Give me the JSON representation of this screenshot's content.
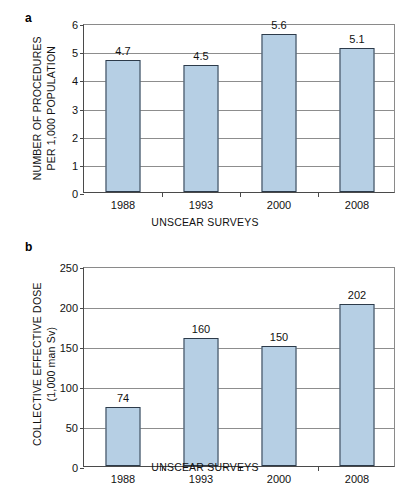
{
  "figure": {
    "panels": [
      {
        "letter": "a",
        "chart_data": {
          "type": "bar",
          "title": "",
          "subtitle": "",
          "categories": [
            "1988",
            "1993",
            "2000",
            "2008"
          ],
          "values": [
            4.7,
            4.5,
            5.6,
            5.1
          ],
          "data_labels": [
            "4.7",
            "4.5",
            "5.6",
            "5.1"
          ],
          "xlabel": "UNSCEAR SURVEYS",
          "ylabel_line1": "NUMBER OF PROCEDURES",
          "ylabel_line2": "PER 1,000 POPULATION",
          "ylim": [
            0,
            6
          ],
          "ytick_values": [
            0,
            1,
            2,
            3,
            4,
            5,
            6
          ],
          "ytick_labels": [
            "0",
            "1",
            "2",
            "3",
            "4",
            "5",
            "6"
          ],
          "grid": true,
          "legend": "none",
          "bar_fill_color": "#b6cfe4",
          "bar_border_color": "#2d3b4a"
        }
      },
      {
        "letter": "b",
        "chart_data": {
          "type": "bar",
          "title": "",
          "subtitle": "",
          "categories": [
            "1988",
            "1993",
            "2000",
            "2008"
          ],
          "values": [
            74,
            160,
            150,
            202
          ],
          "data_labels": [
            "74",
            "160",
            "150",
            "202"
          ],
          "xlabel": "UNSCEAR SURVEYS",
          "ylabel_line1": "COLLECTIVE EFFECTIVE DOSE",
          "ylabel_line2": "(1,000 man Sv)",
          "ylim": [
            0,
            250
          ],
          "ytick_values": [
            0,
            50,
            100,
            150,
            200,
            250
          ],
          "ytick_labels": [
            "0",
            "50",
            "100",
            "150",
            "200",
            "250"
          ],
          "grid": true,
          "legend": "none",
          "bar_fill_color": "#b6cfe4",
          "bar_border_color": "#2d3b4a"
        }
      }
    ]
  }
}
